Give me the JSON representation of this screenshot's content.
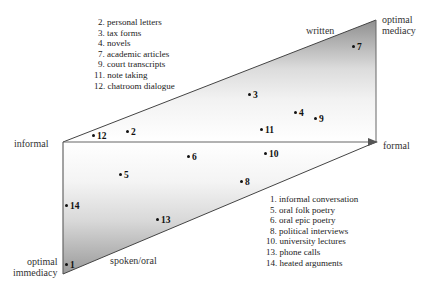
{
  "axes": {
    "informal": "informal",
    "formal": "formal",
    "written": "written",
    "spoken": "spoken/oral",
    "optimal_mediacy": [
      "optimal",
      "mediacy"
    ],
    "optimal_immediacy": [
      "optimal",
      "immediacy"
    ]
  },
  "legend_written": [
    "2. personal letters",
    "3. tax forms",
    "4. novels",
    "7. academic articles",
    "9. court transcripts",
    "11. note taking",
    "12. chatroom dialogue"
  ],
  "legend_spoken": [
    "1. informal conversation",
    "5. oral folk poetry",
    "6. oral epic poetry",
    "8. political interviews",
    "10. university lectures",
    "13. phone calls",
    "14. heated arguments"
  ],
  "points": [
    {
      "id": "7",
      "x": 354,
      "y": 47
    },
    {
      "id": "3",
      "x": 250,
      "y": 95
    },
    {
      "id": "4",
      "x": 296,
      "y": 113
    },
    {
      "id": "9",
      "x": 316,
      "y": 119
    },
    {
      "id": "11",
      "x": 262,
      "y": 130
    },
    {
      "id": "12",
      "x": 94,
      "y": 136
    },
    {
      "id": "2",
      "x": 128,
      "y": 132
    },
    {
      "id": "6",
      "x": 189,
      "y": 157
    },
    {
      "id": "10",
      "x": 266,
      "y": 154
    },
    {
      "id": "5",
      "x": 121,
      "y": 175
    },
    {
      "id": "8",
      "x": 242,
      "y": 182
    },
    {
      "id": "14",
      "x": 67,
      "y": 206
    },
    {
      "id": "13",
      "x": 158,
      "y": 220
    },
    {
      "id": "1",
      "x": 67,
      "y": 265
    }
  ]
}
